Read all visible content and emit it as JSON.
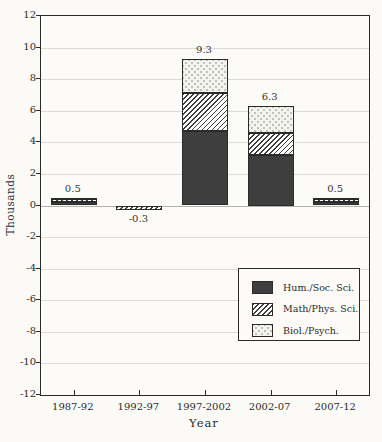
{
  "chart_data": {
    "type": "bar",
    "stacked": true,
    "title": "",
    "xlabel": "Year",
    "ylabel": "Thousands",
    "ylim": [
      -12,
      12
    ],
    "yticks": [
      12,
      10,
      8,
      6,
      4,
      2,
      0,
      -2,
      -4,
      -6,
      -8,
      -10,
      -12
    ],
    "grid": true,
    "legend_position": "lower-right",
    "categories": [
      "1987-92",
      "1992-97",
      "1997-2002",
      "2002-07",
      "2007-12"
    ],
    "series": [
      {
        "name": "Hum./Soc. Sci.",
        "pattern": "solid-dark",
        "values": [
          0.2,
          0,
          4.7,
          3.2,
          0.2
        ]
      },
      {
        "name": "Math/Phys. Sci.",
        "pattern": "diagonal-hatch",
        "values": [
          0.2,
          -0.3,
          2.4,
          1.4,
          0.2
        ]
      },
      {
        "name": "Biol./Psych.",
        "pattern": "light-dots",
        "values": [
          0.1,
          0,
          2.2,
          1.7,
          0.1
        ]
      }
    ],
    "bar_total_labels": [
      "0.5",
      "-0.3",
      "9.3",
      "6.3",
      "0.5"
    ],
    "colors": {
      "dark_fill": "#3e3e3e",
      "hatch_line": "#3f3f3f",
      "dots_background": "#f4f4ef",
      "grid": "#dcdcd6",
      "frame": "#2b2b2b"
    }
  }
}
